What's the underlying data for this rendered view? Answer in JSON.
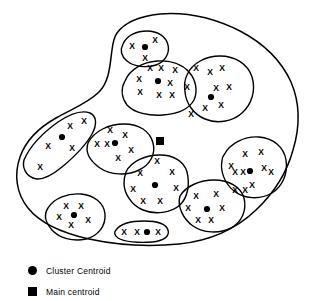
{
  "figure": {
    "name": "cluster-diagram",
    "top_cropped_text": ""
  },
  "legend": {
    "items": [
      {
        "marker": "circle",
        "label": "Cluster Centroid",
        "color": "#000000"
      },
      {
        "marker": "square",
        "label": "Main centroid",
        "color": "#000000"
      }
    ]
  },
  "colors": {
    "stroke": "#000000",
    "background": "#ffffff",
    "marker": "#000000"
  },
  "chart_data": {
    "type": "scatter",
    "title": "",
    "xlabel": "",
    "ylabel": "",
    "xlim": [
      0,
      310
    ],
    "ylim": [
      0,
      301
    ],
    "grid": false,
    "legend_position": "bottom-left",
    "point_glyph": "x",
    "outer_boundary": {
      "name": "data-space-boundary",
      "path": "M 117 33 C 125 22 141 16 160 14 C 186 12 214 18 240 31 C 263 43 281 60 291 82 C 300 103 300 127 293 150 C 287 172 274 193 256 210 C 236 229 209 241 179 244 C 148 247 117 245 89 239 C 62 233 40 223 28 208 C 16 193 14 174 20 157 C 26 140 40 127 56 118 C 72 109 88 103 99 92 C 110 81 110 63 112 50 C 113 42 114 37 117 33 Z"
    },
    "main_centroid": {
      "x": 160,
      "y": 141
    },
    "clusters": [
      {
        "id": "cluster-1",
        "name": "top-left-small-cluster",
        "boundary": "M 123 44 C 127 35 137 31 147 31 C 157 31 166 36 168 45 C 170 53 165 62 156 65 C 147 68 134 67 127 61 C 121 56 120 50 123 44 Z",
        "centroid": {
          "x": 145,
          "y": 47
        },
        "points": [
          {
            "x": 132,
            "y": 46
          },
          {
            "x": 155,
            "y": 40
          },
          {
            "x": 145,
            "y": 58
          }
        ]
      },
      {
        "id": "cluster-2",
        "name": "upper-middle-cluster",
        "boundary": "M 125 81 C 130 69 143 62 157 61 C 170 60 182 64 189 72 C 196 80 198 91 194 100 C 189 109 177 114 163 115 C 149 116 134 113 127 105 C 121 97 121 88 125 81 Z",
        "centroid": {
          "x": 158,
          "y": 81
        },
        "points": [
          {
            "x": 150,
            "y": 68
          },
          {
            "x": 161,
            "y": 68
          },
          {
            "x": 175,
            "y": 70
          },
          {
            "x": 139,
            "y": 79
          },
          {
            "x": 170,
            "y": 83
          },
          {
            "x": 140,
            "y": 92
          },
          {
            "x": 159,
            "y": 95
          },
          {
            "x": 172,
            "y": 95
          }
        ]
      },
      {
        "id": "cluster-3",
        "name": "upper-right-cluster",
        "boundary": "M 187 75 C 192 63 206 56 220 56 C 235 56 248 64 252 77 C 256 90 252 104 242 113 C 232 122 217 124 205 119 C 193 114 186 103 185 92 C 184 85 185 79 187 75 Z",
        "centroid": {
          "x": 211,
          "y": 97
        },
        "points": [
          {
            "x": 196,
            "y": 68
          },
          {
            "x": 210,
            "y": 72
          },
          {
            "x": 222,
            "y": 68
          },
          {
            "x": 187,
            "y": 87
          },
          {
            "x": 216,
            "y": 88
          },
          {
            "x": 229,
            "y": 87
          },
          {
            "x": 205,
            "y": 108
          },
          {
            "x": 221,
            "y": 105
          },
          {
            "x": 191,
            "y": 114
          }
        ]
      },
      {
        "id": "cluster-4",
        "name": "left-elongated-cluster",
        "boundary": "M 24 160 C 30 146 44 132 58 122 C 70 114 82 110 90 113 C 97 116 97 125 92 134 C 86 145 74 157 62 167 C 51 176 40 181 33 178 C 26 175 22 168 24 160 Z",
        "centroid": {
          "x": 62,
          "y": 137
        },
        "points": [
          {
            "x": 70,
            "y": 126
          },
          {
            "x": 84,
            "y": 121
          },
          {
            "x": 48,
            "y": 146
          },
          {
            "x": 72,
            "y": 148
          },
          {
            "x": 40,
            "y": 167
          }
        ]
      },
      {
        "id": "cluster-5",
        "name": "left-middle-cluster",
        "boundary": "M 88 143 C 94 131 109 124 124 124 C 139 124 150 131 153 143 C 156 154 150 165 139 170 C 127 176 110 175 100 168 C 90 161 85 152 88 143 Z",
        "centroid": {
          "x": 115,
          "y": 143
        },
        "points": [
          {
            "x": 110,
            "y": 130
          },
          {
            "x": 125,
            "y": 135
          },
          {
            "x": 97,
            "y": 144
          },
          {
            "x": 107,
            "y": 144
          },
          {
            "x": 131,
            "y": 150
          },
          {
            "x": 118,
            "y": 158
          }
        ]
      },
      {
        "id": "cluster-6",
        "name": "center-bottom-cluster",
        "boundary": "M 126 172 C 131 161 146 155 160 155 C 173 155 184 161 187 172 C 190 184 188 197 180 205 C 171 213 155 215 143 210 C 131 205 124 193 124 183 C 124 178 125 175 126 172 Z",
        "centroid": {
          "x": 155,
          "y": 185
        },
        "points": [
          {
            "x": 157,
            "y": 161
          },
          {
            "x": 140,
            "y": 173
          },
          {
            "x": 172,
            "y": 172
          },
          {
            "x": 133,
            "y": 189
          },
          {
            "x": 176,
            "y": 188
          },
          {
            "x": 143,
            "y": 201
          },
          {
            "x": 160,
            "y": 201
          }
        ]
      },
      {
        "id": "cluster-7",
        "name": "right-middle-cluster",
        "boundary": "M 224 155 C 230 143 245 136 259 137 C 273 138 284 147 286 160 C 288 173 283 186 272 193 C 260 200 244 199 234 191 C 224 183 220 170 222 161 C 222 158 223 156 224 155 Z",
        "centroid": {
          "x": 250,
          "y": 171
        },
        "points": [
          {
            "x": 245,
            "y": 154
          },
          {
            "x": 261,
            "y": 152
          },
          {
            "x": 231,
            "y": 166
          },
          {
            "x": 264,
            "y": 168
          },
          {
            "x": 235,
            "y": 172
          },
          {
            "x": 243,
            "y": 172
          },
          {
            "x": 271,
            "y": 172
          },
          {
            "x": 252,
            "y": 185
          },
          {
            "x": 235,
            "y": 190
          },
          {
            "x": 245,
            "y": 190
          }
        ]
      },
      {
        "id": "cluster-8",
        "name": "bottom-right-cluster",
        "boundary": "M 180 196 C 186 186 200 180 214 180 C 229 180 241 187 244 198 C 247 210 242 222 231 228 C 219 234 203 233 193 226 C 183 219 177 206 180 196 Z",
        "centroid": {
          "x": 207,
          "y": 209
        },
        "points": [
          {
            "x": 196,
            "y": 196
          },
          {
            "x": 216,
            "y": 194
          },
          {
            "x": 188,
            "y": 208
          },
          {
            "x": 222,
            "y": 208
          },
          {
            "x": 198,
            "y": 220
          },
          {
            "x": 211,
            "y": 220
          }
        ]
      },
      {
        "id": "cluster-9",
        "name": "bottom-left-cluster",
        "boundary": "M 48 208 C 54 198 68 193 81 194 C 94 195 104 203 105 214 C 106 226 98 236 86 239 C 73 242 59 238 52 230 C 45 222 44 214 48 208 Z",
        "centroid": {
          "x": 74,
          "y": 215
        },
        "points": [
          {
            "x": 66,
            "y": 206
          },
          {
            "x": 81,
            "y": 206
          },
          {
            "x": 59,
            "y": 217
          },
          {
            "x": 71,
            "y": 225
          },
          {
            "x": 88,
            "y": 220
          }
        ]
      },
      {
        "id": "cluster-10",
        "name": "bottom-elongated-cluster",
        "boundary": "M 116 230 C 120 224 131 221 144 221 C 157 221 166 224 168 230 C 170 236 164 241 152 242 C 139 243 124 242 118 238 C 114 235 114 232 116 230 Z",
        "centroid": {
          "x": 147,
          "y": 232
        },
        "points": [
          {
            "x": 124,
            "y": 232
          },
          {
            "x": 137,
            "y": 232
          },
          {
            "x": 158,
            "y": 232
          }
        ]
      }
    ]
  }
}
